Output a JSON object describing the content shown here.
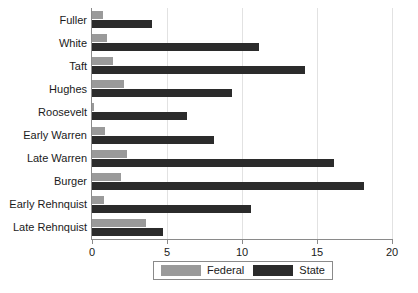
{
  "chart_data": {
    "type": "bar",
    "orientation": "horizontal",
    "title": "",
    "xlabel": "",
    "ylabel": "",
    "xlim": [
      0,
      20
    ],
    "xticks": [
      0,
      5,
      10,
      15,
      20
    ],
    "grid": true,
    "legend_position": "bottom",
    "categories": [
      "Fuller",
      "White",
      "Taft",
      "Hughes",
      "Roosevelt",
      "Early Warren",
      "Late Warren",
      "Burger",
      "Early Rehnquist",
      "Late Rehnquist"
    ],
    "series": [
      {
        "name": "Federal",
        "color": "#9a9a9a",
        "values": [
          0.7,
          1.0,
          1.4,
          2.1,
          0.15,
          0.85,
          2.3,
          1.9,
          0.8,
          3.6
        ]
      },
      {
        "name": "State",
        "color": "#2b2b2b",
        "values": [
          4.0,
          11.1,
          14.2,
          9.3,
          6.3,
          8.1,
          16.1,
          18.1,
          10.6,
          4.7
        ]
      }
    ]
  },
  "legend": {
    "entries": [
      {
        "label": "Federal",
        "swatch": "federal-swatch"
      },
      {
        "label": "State",
        "swatch": "state-swatch"
      }
    ]
  }
}
